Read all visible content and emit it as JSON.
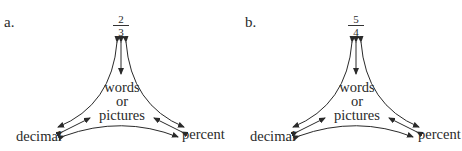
{
  "panels": [
    {
      "label": "a.",
      "top_node": {
        "numerator": "2",
        "denominator": "3"
      },
      "center_node": {
        "line1": "words",
        "line2": "or",
        "line3": "pictures"
      },
      "left_node": "decimal",
      "right_node": "percent"
    },
    {
      "label": "b.",
      "top_node": {
        "numerator": "5",
        "denominator": "4"
      },
      "center_node": {
        "line1": "words",
        "line2": "or",
        "line3": "pictures"
      },
      "left_node": "decimal",
      "right_node": "percent"
    }
  ],
  "colors": {
    "ink": "#2a2a2a",
    "background": "#ffffff"
  }
}
